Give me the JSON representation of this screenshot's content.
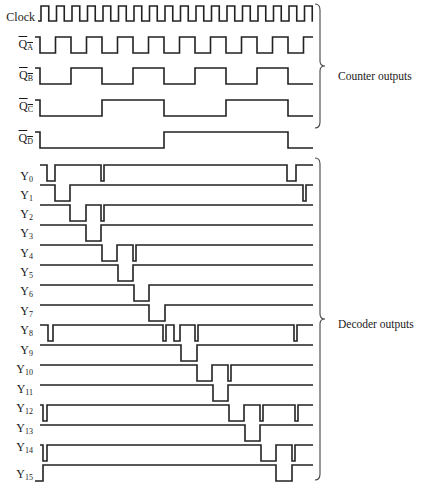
{
  "figure": {
    "stroke_color": "#222222",
    "groups": [
      {
        "label": "Counter outputs",
        "brace_top": 4,
        "brace_bottom": 128,
        "label_x": 338,
        "label_y": 78
      },
      {
        "label": "Decoder outputs",
        "brace_top": 158,
        "brace_bottom": 480,
        "label_x": 338,
        "label_y": 326
      }
    ],
    "clock": {
      "label": "Clock",
      "start_x": 38,
      "first_edge": 41,
      "half_period": 7.75,
      "end_x": 313,
      "y_high": 6,
      "y_low": 21,
      "label_y": 14
    },
    "counter_outputs": [
      {
        "name": "QA",
        "label_main": "Q",
        "label_sub": "A",
        "inverted": true,
        "y_high": 37,
        "y_low": 53,
        "label_y": 46,
        "edges": [
          40,
          55.5,
          71,
          86.5,
          102,
          117.5,
          133,
          148.5,
          164,
          179.5,
          195,
          210.5,
          226,
          241.5,
          257,
          272.5,
          288,
          303.5
        ],
        "start_high": true,
        "end_x": 313
      },
      {
        "name": "QB",
        "label_main": "Q",
        "label_sub": "B",
        "inverted": true,
        "y_high": 68,
        "y_low": 84,
        "label_y": 77,
        "edges": [
          40,
          71,
          102,
          133,
          164,
          195,
          226,
          257,
          288
        ],
        "start_high": true,
        "end_x": 313
      },
      {
        "name": "QC",
        "label_main": "Q",
        "label_sub": "C",
        "inverted": true,
        "y_high": 100,
        "y_low": 116,
        "label_y": 108,
        "edges": [
          40,
          102,
          164,
          226,
          288
        ],
        "start_high": true,
        "end_x": 313
      },
      {
        "name": "QD",
        "label_main": "Q",
        "label_sub": "D",
        "inverted": true,
        "y_high": 132,
        "y_low": 148,
        "label_y": 140,
        "edges": [
          40,
          164,
          288
        ],
        "start_high": true,
        "end_x": 313
      }
    ],
    "decoder_outputs": [
      {
        "name": "Y0",
        "label_main": "Y",
        "label_sub": "0",
        "y_high": 165,
        "y_low": 181,
        "label_y": 178,
        "pulses": [
          [
            47,
            55
          ],
          [
            101,
            104
          ],
          [
            287,
            296
          ]
        ]
      },
      {
        "name": "Y1",
        "label_main": "Y",
        "label_sub": "1",
        "y_high": 185,
        "y_low": 201,
        "label_y": 197,
        "pulses": [
          [
            55,
            70
          ],
          [
            303,
            306
          ]
        ],
        "note": "ends low at right"
      },
      {
        "name": "Y2",
        "label_main": "Y",
        "label_sub": "2",
        "y_high": 205,
        "y_low": 221,
        "label_y": 216,
        "pulses": [
          [
            70,
            86
          ],
          [
            101,
            104
          ]
        ]
      },
      {
        "name": "Y3",
        "label_main": "Y",
        "label_sub": "3",
        "y_high": 225,
        "y_low": 241,
        "label_y": 235,
        "pulses": [
          [
            86,
            101
          ]
        ]
      },
      {
        "name": "Y4",
        "label_main": "Y",
        "label_sub": "4",
        "y_high": 245,
        "y_low": 261,
        "label_y": 255,
        "pulses": [
          [
            102,
            117
          ],
          [
            133,
            136
          ]
        ]
      },
      {
        "name": "Y5",
        "label_main": "Y",
        "label_sub": "5",
        "y_high": 265,
        "y_low": 281,
        "label_y": 274,
        "pulses": [
          [
            118,
            133
          ]
        ]
      },
      {
        "name": "Y6",
        "label_main": "Y",
        "label_sub": "6",
        "y_high": 285,
        "y_low": 301,
        "label_y": 293,
        "pulses": [
          [
            134,
            149
          ]
        ]
      },
      {
        "name": "Y7",
        "label_main": "Y",
        "label_sub": "7",
        "y_high": 305,
        "y_low": 321,
        "label_y": 313,
        "pulses": [
          [
            149,
            165
          ]
        ]
      },
      {
        "name": "Y8",
        "label_main": "Y",
        "label_sub": "8",
        "y_high": 325,
        "y_low": 341,
        "label_y": 332,
        "pulses": [
          [
            48,
            53
          ],
          [
            163,
            166
          ],
          [
            174,
            180
          ],
          [
            195,
            198
          ],
          [
            294,
            297
          ]
        ]
      },
      {
        "name": "Y9",
        "label_main": "Y",
        "label_sub": "9",
        "y_high": 345,
        "y_low": 361,
        "label_y": 352,
        "pulses": [
          [
            181,
            197
          ]
        ]
      },
      {
        "name": "Y10",
        "label_main": "Y",
        "label_sub": "10",
        "y_high": 365,
        "y_low": 381,
        "label_y": 371,
        "pulses": [
          [
            197,
            212
          ],
          [
            228,
            231
          ]
        ]
      },
      {
        "name": "Y11",
        "label_main": "Y",
        "label_sub": "11",
        "y_high": 385,
        "y_low": 401,
        "label_y": 391,
        "pulses": [
          [
            213,
            228
          ]
        ]
      },
      {
        "name": "Y12",
        "label_main": "Y",
        "label_sub": "12",
        "y_high": 405,
        "y_low": 421,
        "label_y": 410,
        "pulses": [
          [
            43,
            47
          ],
          [
            229,
            244
          ],
          [
            260,
            263
          ],
          [
            295,
            298
          ]
        ]
      },
      {
        "name": "Y13",
        "label_main": "Y",
        "label_sub": "13",
        "y_high": 425,
        "y_low": 441,
        "label_y": 430,
        "pulses": [
          [
            245,
            260
          ]
        ]
      },
      {
        "name": "Y14",
        "label_main": "Y",
        "label_sub": "14",
        "y_high": 445,
        "y_low": 461,
        "label_y": 449,
        "pulses": [
          [
            43,
            47
          ],
          [
            261,
            276
          ],
          [
            292,
            295
          ]
        ]
      },
      {
        "name": "Y15",
        "label_main": "Y",
        "label_sub": "15",
        "y_high": 465,
        "y_low": 481,
        "label_y": 476,
        "pulses": [
          [
            276,
            292
          ]
        ],
        "start_low_until": 43
      }
    ],
    "wave_start_x": 35,
    "wave_end_x": 313
  }
}
